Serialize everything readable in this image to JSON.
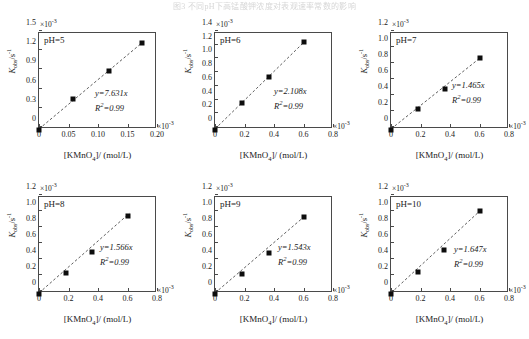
{
  "caption": "图3 不同pH下高锰酸钾浓度对表观速率常数的影响",
  "axis": {
    "xlabel_html": "[KMnO<sub>4</sub>]/ (mol/L)",
    "ylabel_html": "<i>K</i><sub>obs</sub>/s<sup>-1</sup>",
    "exponent": "×10",
    "exponent_power": "-3"
  },
  "chart_data": {
    "type": "scatter",
    "title": "",
    "xlabel": "[KMnO4]/ (mol/L)",
    "ylabel": "Kobs/s^-1",
    "x_scale": 0.001,
    "y_scale": 0.001,
    "grid": false,
    "legend": "none",
    "panels": [
      {
        "id": "ph5",
        "label": "pH=5",
        "equation": "y=7.631x",
        "r2": "R²=0.99",
        "slope": 7.631,
        "r_squared": 0.99,
        "xlim": [
          0,
          0.2
        ],
        "ylim": [
          0,
          1.5
        ],
        "xticks": [
          "0",
          "0.05",
          "0.10",
          "0.15",
          "0.20"
        ],
        "xtick_values": [
          0,
          0.05,
          0.1,
          0.15,
          0.2
        ],
        "yticks": [
          "0",
          "0.3",
          "0.6",
          "0.9",
          "1.2",
          "1.5"
        ],
        "ytick_values": [
          0,
          0.3,
          0.6,
          0.9,
          1.2,
          1.5
        ],
        "x": [
          0,
          0.058,
          0.118,
          0.175
        ],
        "y": [
          0,
          0.48,
          0.92,
          1.35
        ]
      },
      {
        "id": "ph6",
        "label": "pH=6",
        "equation": "y=2.108x",
        "r2": "R²=0.99",
        "slope": 2.108,
        "r_squared": 0.99,
        "xlim": [
          0,
          0.8
        ],
        "ylim": [
          0,
          1.4
        ],
        "xticks": [
          "0",
          "0.2",
          "0.4",
          "0.6",
          "0.8"
        ],
        "xtick_values": [
          0,
          0.2,
          0.4,
          0.6,
          0.8
        ],
        "yticks": [
          "0",
          "0.2",
          "0.4",
          "0.6",
          "0.8",
          "1.0",
          "1.2",
          "1.4"
        ],
        "ytick_values": [
          0,
          0.2,
          0.4,
          0.6,
          0.8,
          1.0,
          1.2,
          1.4
        ],
        "x": [
          0,
          0.185,
          0.365,
          0.605
        ],
        "y": [
          0,
          0.38,
          0.77,
          1.27
        ]
      },
      {
        "id": "ph7",
        "label": "pH=7",
        "equation": "y=1.465x",
        "r2": "R²=0.99",
        "slope": 1.465,
        "r_squared": 0.99,
        "xlim": [
          0,
          0.8
        ],
        "ylim": [
          0,
          1.2
        ],
        "xticks": [
          "0",
          "0.2",
          "0.4",
          "0.6",
          "0.8"
        ],
        "xtick_values": [
          0,
          0.2,
          0.4,
          0.6,
          0.8
        ],
        "yticks": [
          "0",
          "0.2",
          "0.4",
          "0.6",
          "0.8",
          "1.0",
          "1.2"
        ],
        "ytick_values": [
          0,
          0.2,
          0.4,
          0.6,
          0.8,
          1.0,
          1.2
        ],
        "x": [
          0,
          0.18,
          0.365,
          0.605
        ],
        "y": [
          0,
          0.255,
          0.51,
          0.89
        ]
      },
      {
        "id": "ph8",
        "label": "pH=8",
        "equation": "y=1.566x",
        "r2": "R²=0.99",
        "slope": 1.566,
        "r_squared": 0.99,
        "xlim": [
          0,
          0.8
        ],
        "ylim": [
          0,
          1.2
        ],
        "xticks": [
          "0",
          "0.2",
          "0.4",
          "0.6",
          "0.8"
        ],
        "xtick_values": [
          0,
          0.2,
          0.4,
          0.6,
          0.8
        ],
        "yticks": [
          "0",
          "0.2",
          "0.4",
          "0.6",
          "0.8",
          "1.0",
          "1.2"
        ],
        "ytick_values": [
          0,
          0.2,
          0.4,
          0.6,
          0.8,
          1.0,
          1.2
        ],
        "x": [
          0,
          0.185,
          0.36,
          0.6
        ],
        "y": [
          0,
          0.26,
          0.52,
          0.975
        ]
      },
      {
        "id": "ph9",
        "label": "pH=9",
        "equation": "y=1.543x",
        "r2": "R²=0.99",
        "slope": 1.543,
        "r_squared": 0.99,
        "xlim": [
          0,
          0.8
        ],
        "ylim": [
          0,
          1.2
        ],
        "xticks": [
          "0",
          "0.2",
          "0.4",
          "0.6",
          "0.8"
        ],
        "xtick_values": [
          0,
          0.2,
          0.4,
          0.6,
          0.8
        ],
        "yticks": [
          "0",
          "0.2",
          "0.4",
          "0.6",
          "0.8",
          "1.0",
          "1.2"
        ],
        "ytick_values": [
          0,
          0.2,
          0.4,
          0.6,
          0.8,
          1.0,
          1.2
        ],
        "x": [
          0,
          0.185,
          0.365,
          0.605
        ],
        "y": [
          0,
          0.25,
          0.51,
          0.955
        ]
      },
      {
        "id": "ph10",
        "label": "pH=10",
        "equation": "y=1.647x",
        "r2": "R²=0.99",
        "slope": 1.647,
        "r_squared": 0.99,
        "xlim": [
          0,
          0.8
        ],
        "ylim": [
          0,
          1.2
        ],
        "xticks": [
          "0",
          "0.2",
          "0.4",
          "0.6",
          "0.8"
        ],
        "xtick_values": [
          0,
          0.2,
          0.4,
          0.6,
          0.8
        ],
        "yticks": [
          "0",
          "0.2",
          "0.4",
          "0.6",
          "0.8",
          "1.0",
          "1.2"
        ],
        "ytick_values": [
          0,
          0.2,
          0.4,
          0.6,
          0.8,
          1.0,
          1.2
        ],
        "x": [
          0,
          0.185,
          0.36,
          0.605
        ],
        "y": [
          0,
          0.275,
          0.545,
          1.03
        ]
      }
    ]
  }
}
